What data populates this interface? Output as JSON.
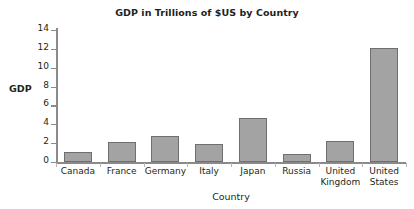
{
  "chart_data": {
    "type": "bar",
    "title": "GDP in Trillions of $US by Country",
    "xlabel": "Country",
    "ylabel": "GDP",
    "categories": [
      "Canada",
      "France",
      "Germany",
      "Italy",
      "Japan",
      "Russia",
      "United Kingdom",
      "United States"
    ],
    "values": [
      1.1,
      2.1,
      2.8,
      1.9,
      4.7,
      0.8,
      2.2,
      12.1
    ],
    "ylim": [
      0,
      14
    ],
    "yticks": [
      0,
      2,
      4,
      6,
      8,
      10,
      12,
      14
    ],
    "ytick_labels": [
      "0",
      "2",
      "4",
      "6",
      "8",
      "10",
      "12",
      "14"
    ],
    "grid": false,
    "legend": false,
    "bar_color": "#a3a3a3",
    "bar_border_color": "#6f6f6f",
    "axis_color": "#8a8a8a",
    "background_color": "#ffffff",
    "text_color": "#231f20"
  }
}
